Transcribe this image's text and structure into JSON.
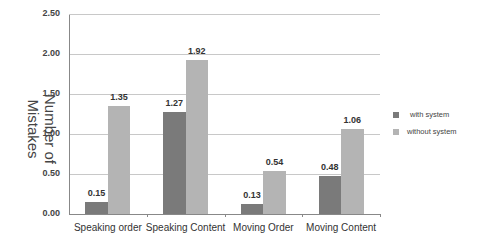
{
  "chart_data": {
    "type": "bar",
    "title": "",
    "xlabel": "",
    "ylabel": "Number of Mistakes",
    "ylim": [
      0,
      2.5
    ],
    "yticks": [
      "0.00",
      "0.50",
      "1.00",
      "1.50",
      "2.00",
      "2.50"
    ],
    "grid": true,
    "legend_position": "right",
    "categories": [
      "Speaking order",
      "Speaking Content",
      "Moving Order",
      "Moving Content"
    ],
    "series": [
      {
        "name": "with system",
        "color": "#7a7a7a",
        "values": [
          0.15,
          1.27,
          0.13,
          0.48
        ],
        "labels": [
          "0.15",
          "1.27",
          "0.13",
          "0.48"
        ]
      },
      {
        "name": "without system",
        "color": "#b4b4b4",
        "values": [
          1.35,
          1.92,
          0.54,
          1.06
        ],
        "labels": [
          "1.35",
          "1.92",
          "0.54",
          "1.06"
        ]
      }
    ]
  }
}
